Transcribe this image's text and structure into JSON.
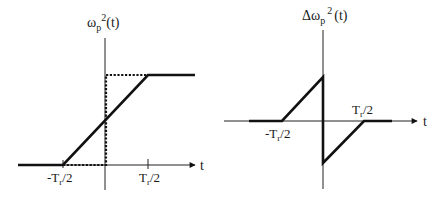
{
  "left_plot": {
    "ylabel_base": "ω",
    "ylabel_sub": "p",
    "ylabel_sup": "2",
    "ylabel_arg": "(t)",
    "xlabel": "t",
    "tick_neg_base": "-T",
    "tick_neg_sub": "r",
    "tick_neg_tail": "/2",
    "tick_pos_base": "T",
    "tick_pos_sub": "r",
    "tick_pos_tail": "/2",
    "description": "Linear ramp of plasma frequency squared from 0 at -Tr/2 to max at Tr/2, with dotted step function reference"
  },
  "right_plot": {
    "ylabel_delta": "Δ",
    "ylabel_base": "ω",
    "ylabel_sub": "p",
    "ylabel_sup": "2",
    "ylabel_arg": "(t)",
    "xlabel": "t",
    "tick_neg_base": "-T",
    "tick_neg_sub": "r",
    "tick_neg_tail": "/2",
    "tick_pos_base": "T",
    "tick_pos_sub": "r",
    "tick_pos_tail": "/2",
    "description": "Difference between ramp and step: rising ramp from -Tr/2 to 0, jump down at t=0, rising ramp back to 0 at Tr/2"
  },
  "colors": {
    "line": "#111111",
    "background": "#ffffff"
  }
}
